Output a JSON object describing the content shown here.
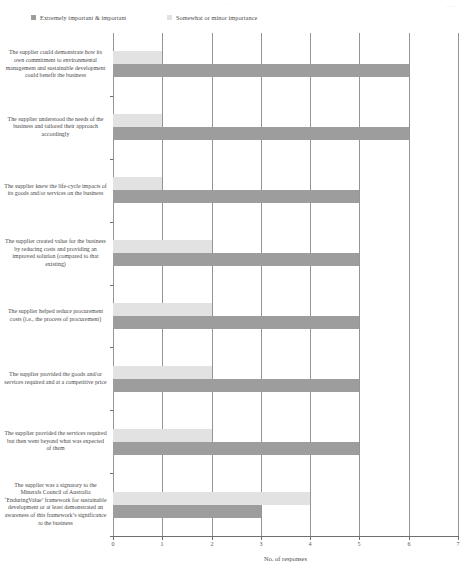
{
  "header": {
    "center_mark": "· · ·",
    "right_mark": "——"
  },
  "legend": {
    "items": [
      {
        "label": "Extremely important & important",
        "color": "#9d9d9d",
        "icon": "legend-square-icon"
      },
      {
        "label": "Somewhat or minor importance",
        "color": "#e2e2e2",
        "icon": "legend-square-icon"
      }
    ]
  },
  "axis": {
    "x_title": "No. of responses",
    "x_ticks": [
      "0",
      "1",
      "2",
      "3",
      "4",
      "5",
      "6",
      "7"
    ]
  },
  "chart_data": {
    "type": "bar",
    "orientation": "horizontal",
    "title": "",
    "xlabel": "No. of responses",
    "ylabel": "",
    "xlim": [
      0,
      7
    ],
    "grid": true,
    "legend_position": "top",
    "categories": [
      "The supplier could demonstrate how its own commitment to environmental management and sustainable development could benefit the business",
      "The supplier understood the needs of the business and tailored their approach accordingly",
      "The supplier knew the life-cycle impacts of its goods and/or services on the business",
      "The supplier created value for the business by reducing costs and providing an improved solution (compared to that existing)",
      "The supplier helped reduce procurement costs (i.e., the process of procurement)",
      "The supplier provided the goods and/or services required and at a competitive price",
      "The supplier provided the services required but then went beyond what was expected of them",
      "The supplier was a signatory to the Minerals Council of Australia ‘EnduringValue’ framework for sustainable development or at least demonstrated an awareness of this framework’s significance to the business"
    ],
    "series": [
      {
        "name": "Somewhat or minor importance",
        "color": "#e2e2e2",
        "values": [
          1,
          1,
          1,
          2,
          2,
          2,
          2,
          4
        ]
      },
      {
        "name": "Extremely important & important",
        "color": "#9d9d9d",
        "values": [
          6,
          6,
          5,
          5,
          5,
          5,
          5,
          3
        ]
      }
    ]
  }
}
